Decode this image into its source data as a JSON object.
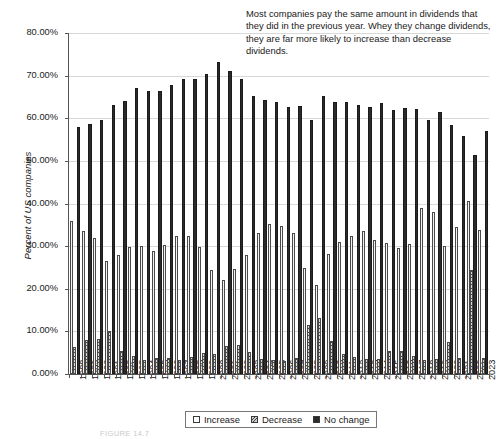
{
  "chart_data": {
    "type": "bar",
    "title": "",
    "xlabel": "",
    "ylabel": "Percent of US companies",
    "ylim": [
      0,
      80
    ],
    "ytick_labels": [
      "0.00%",
      "10.00%",
      "20.00%",
      "30.00%",
      "40.00%",
      "50.00%",
      "60.00%",
      "70.00%",
      "80.00%"
    ],
    "ytick_values": [
      0,
      10,
      20,
      30,
      40,
      50,
      60,
      70,
      80
    ],
    "grid": true,
    "legend_position": "bottom-center",
    "categories": [
      "1988",
      "1989",
      "1990",
      "1991",
      "1992",
      "1993",
      "1994",
      "1995",
      "1996",
      "1997",
      "1998",
      "1999",
      "2000",
      "2001",
      "2002",
      "2003",
      "2004",
      "2005",
      "2006",
      "2007",
      "2008",
      "2009",
      "2010",
      "2011",
      "2012",
      "2013",
      "2014",
      "2015",
      "2016",
      "2017",
      "2018",
      "2019",
      "2020",
      "2021",
      "2022",
      "2023"
    ],
    "series": [
      {
        "name": "Increase",
        "values": [
          36.0,
          33.6,
          31.9,
          26.6,
          27.9,
          29.9,
          30.1,
          28.9,
          30.2,
          32.4,
          32.4,
          29.9,
          24.5,
          22.1,
          24.6,
          28.0,
          33.2,
          35.1,
          34.8,
          33.2,
          24.8,
          20.9,
          28.2,
          31.0,
          32.4,
          33.5,
          31.5,
          30.8,
          29.6,
          30.5,
          38.9,
          38.1,
          30.1,
          34.4,
          40.5,
          33.9
        ],
        "color": "#f2f2f2"
      },
      {
        "name": "Decrease",
        "values": [
          6.4,
          7.9,
          8.2,
          10.2,
          5.5,
          4.2,
          3.3,
          3.7,
          3.7,
          3.2,
          4.1,
          5.0,
          4.6,
          6.5,
          6.9,
          5.1,
          3.6,
          3.2,
          3.0,
          3.8,
          11.5,
          13.1,
          7.8,
          4.6,
          4.0,
          3.5,
          3.6,
          5.5,
          5.5,
          4.2,
          3.2,
          3.5,
          7.4,
          3.8,
          24.3,
          3.8
        ],
        "color": "#d9d9d9"
      },
      {
        "name": "No change",
        "values": [
          58.0,
          58.6,
          59.6,
          63.2,
          64.1,
          67.1,
          66.5,
          66.5,
          67.7,
          69.2,
          69.1,
          70.5,
          73.1,
          71.0,
          69.1,
          65.2,
          64.4,
          63.7,
          62.6,
          62.9,
          59.7,
          65.3,
          63.8,
          63.9,
          63.2,
          62.6,
          63.6,
          62.0,
          62.4,
          62.1,
          59.5,
          61.5,
          58.4,
          55.9,
          51.3,
          57.0
        ],
        "color": "#2b2b2b"
      }
    ]
  },
  "annotation": {
    "text": "Most companies pay the same amount in dividends that they did in the previous year. Whey they change dividends, they are far more likely to increase than decrease dividends."
  },
  "legend": {
    "items": [
      {
        "label": "Increase",
        "swatch": "increase-swatch"
      },
      {
        "label": "Decrease",
        "swatch": "decrease-swatch"
      },
      {
        "label": "No change",
        "swatch": "nochange-swatch"
      }
    ]
  },
  "caption": {
    "text": "FIGURE 14.7"
  }
}
